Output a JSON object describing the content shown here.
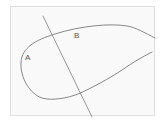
{
  "diagram": {
    "labels": {
      "a": "A",
      "b": "B"
    },
    "colors": {
      "background": "#f9f9f9",
      "frame_border": "#dedede",
      "curve_stroke": "#7a7a7a",
      "line_stroke": "#8a8a8a",
      "label_text": "#555555"
    },
    "elements": [
      {
        "type": "open-curve",
        "description": "closed loop on left side, open toward the right with upper and lower arms"
      },
      {
        "type": "straight-line",
        "description": "line crossing the curve at two points"
      },
      {
        "type": "point-label",
        "text": "A",
        "position": "left of curve interior"
      },
      {
        "type": "point-label",
        "text": "B",
        "position": "near top of curve, right of line"
      }
    ]
  }
}
